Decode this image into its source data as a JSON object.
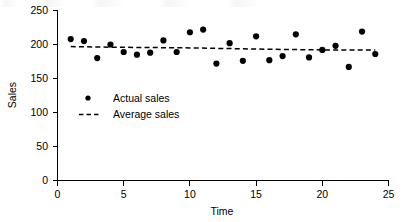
{
  "chart_data": {
    "type": "scatter",
    "title": "",
    "xlabel": "Time",
    "ylabel": "Sales",
    "xlim": [
      0,
      25
    ],
    "ylim": [
      0,
      250
    ],
    "xticks": [
      0,
      5,
      10,
      15,
      20,
      25
    ],
    "yticks": [
      0,
      50,
      100,
      150,
      200,
      250
    ],
    "grid": false,
    "legend_position": "inside-left",
    "series": [
      {
        "name": "Actual sales",
        "marker": "filled-circle",
        "color": "#000000",
        "x": [
          1,
          2,
          3,
          4,
          5,
          6,
          7,
          8,
          9,
          10,
          11,
          12,
          13,
          14,
          15,
          16,
          17,
          18,
          19,
          20,
          21,
          22,
          23,
          24
        ],
        "values": [
          208,
          205,
          180,
          200,
          189,
          185,
          188,
          206,
          189,
          218,
          222,
          172,
          202,
          176,
          212,
          177,
          183,
          215,
          181,
          192,
          198,
          167,
          219,
          186
        ]
      },
      {
        "name": "Average sales",
        "marker": "dashed-line",
        "color": "#000000",
        "x": [
          1,
          4,
          10,
          16,
          20,
          24
        ],
        "values": [
          197,
          196,
          195,
          193,
          192,
          192
        ]
      }
    ],
    "legend": [
      {
        "label": "Actual sales",
        "marker": "dot"
      },
      {
        "label": "Average sales",
        "marker": "dash"
      }
    ]
  },
  "axes": {
    "y_label": "Sales",
    "x_label": "Time",
    "y_tick_labels": [
      "250",
      "200",
      "150",
      "100",
      "50",
      "0"
    ],
    "x_tick_labels": [
      "0",
      "5",
      "10",
      "15",
      "20",
      "25"
    ]
  },
  "legend": {
    "actual_label": "Actual sales",
    "average_label": "Average sales"
  },
  "colors": {
    "foreground": "#000000",
    "background": "#ffffff"
  }
}
